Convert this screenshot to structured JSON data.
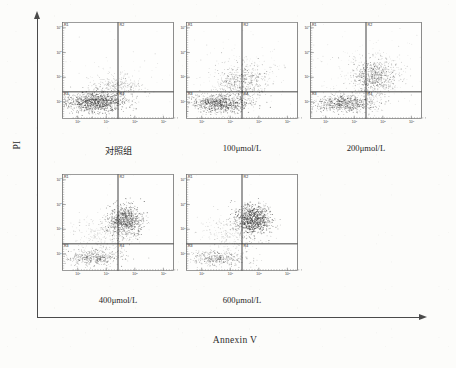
{
  "figure": {
    "type": "flow-cytometry-dot-plot-panel",
    "x_axis_title": "Annexin V",
    "y_axis_title": "PI",
    "panel_count": 5
  },
  "axis": {
    "x_tick_labels": [
      "10",
      "10",
      "10",
      "10"
    ],
    "x_tick_exponents": [
      "0",
      "1",
      "2",
      "3"
    ],
    "y_tick_labels": [
      "10",
      "10",
      "10",
      "10"
    ],
    "y_tick_exponents": [
      "3",
      "2",
      "1",
      "0"
    ]
  },
  "quadrants": {
    "upper_left": "R1",
    "upper_right": "R2",
    "lower_left": "R3",
    "lower_right": "R4"
  },
  "panels": [
    {
      "id": "panel-control",
      "caption": "对照组",
      "caption_is_cjk": true,
      "row": 0,
      "col": 0
    },
    {
      "id": "panel-100",
      "caption": "100μmol/L",
      "caption_is_cjk": false,
      "row": 0,
      "col": 1
    },
    {
      "id": "panel-200",
      "caption": "200μmol/L",
      "caption_is_cjk": false,
      "row": 0,
      "col": 2
    },
    {
      "id": "panel-400",
      "caption": "400μmol/L",
      "caption_is_cjk": false,
      "row": 1,
      "col": 0
    },
    {
      "id": "panel-600",
      "caption": "600μmol/L",
      "caption_is_cjk": false,
      "row": 1,
      "col": 1
    }
  ],
  "chart_data": {
    "type": "scatter",
    "title": "",
    "xlabel": "Annexin V",
    "ylabel": "PI",
    "xlim": [
      0,
      100
    ],
    "ylim": [
      0,
      100
    ],
    "grid": false,
    "legend": null,
    "quadrant_divider_x": 50,
    "quadrant_divider_y": 72,
    "quadrant_names": [
      "R1",
      "R2",
      "R3",
      "R4"
    ],
    "series": [
      {
        "name": "对照组",
        "panel": "panel-control",
        "n_points": 1450,
        "clusters": [
          {
            "label": "viable-R3",
            "cx": 30,
            "cy": 83,
            "sx": 13,
            "sy": 5.0,
            "n": 1120,
            "opacity": 0.72
          },
          {
            "label": "early-R4-R2-smear",
            "cx": 50,
            "cy": 66,
            "sx": 11,
            "sy": 6.0,
            "n": 270,
            "opacity": 0.42
          },
          {
            "label": "sparse-background",
            "cx": 48,
            "cy": 55,
            "sx": 26,
            "sy": 16,
            "n": 60,
            "opacity": 0.22
          }
        ]
      },
      {
        "name": "100μmol/L",
        "panel": "panel-100",
        "n_points": 1500,
        "clusters": [
          {
            "label": "viable-R3",
            "cx": 30,
            "cy": 84,
            "sx": 13,
            "sy": 4.6,
            "n": 820,
            "opacity": 0.66
          },
          {
            "label": "apoptotic-rise",
            "cx": 51,
            "cy": 62,
            "sx": 11,
            "sy": 9.5,
            "n": 520,
            "opacity": 0.5
          },
          {
            "label": "sparse-background",
            "cx": 50,
            "cy": 52,
            "sx": 27,
            "sy": 18,
            "n": 160,
            "opacity": 0.22
          }
        ]
      },
      {
        "name": "200μmol/L",
        "panel": "panel-200",
        "n_points": 1550,
        "clusters": [
          {
            "label": "viable-R3",
            "cx": 31,
            "cy": 84,
            "sx": 13.5,
            "sy": 4.4,
            "n": 700,
            "opacity": 0.62
          },
          {
            "label": "late-apoptotic-R2",
            "cx": 57,
            "cy": 57,
            "sx": 10,
            "sy": 9.5,
            "n": 620,
            "opacity": 0.56
          },
          {
            "label": "sparse-background",
            "cx": 52,
            "cy": 55,
            "sx": 27,
            "sy": 19,
            "n": 230,
            "opacity": 0.22
          }
        ]
      },
      {
        "name": "400μmol/L",
        "panel": "panel-400",
        "n_points": 1520,
        "clusters": [
          {
            "label": "viable-R3-reduced",
            "cx": 28,
            "cy": 86,
            "sx": 14,
            "sy": 4.2,
            "n": 470,
            "opacity": 0.55
          },
          {
            "label": "late-apoptotic-R2-dense",
            "cx": 57,
            "cy": 48,
            "sx": 7.5,
            "sy": 8.0,
            "n": 780,
            "opacity": 0.74
          },
          {
            "label": "transition-smear",
            "cx": 40,
            "cy": 60,
            "sx": 14,
            "sy": 9,
            "n": 270,
            "opacity": 0.3
          }
        ]
      },
      {
        "name": "600μmol/L",
        "panel": "panel-600",
        "n_points": 1560,
        "clusters": [
          {
            "label": "viable-R3-minor",
            "cx": 28,
            "cy": 87,
            "sx": 14,
            "sy": 4.0,
            "n": 380,
            "opacity": 0.5
          },
          {
            "label": "late-apoptotic-R2-dense",
            "cx": 60,
            "cy": 47,
            "sx": 8.0,
            "sy": 7.5,
            "n": 900,
            "opacity": 0.8
          },
          {
            "label": "transition-smear",
            "cx": 44,
            "cy": 60,
            "sx": 15,
            "sy": 9,
            "n": 280,
            "opacity": 0.3
          }
        ]
      }
    ]
  }
}
